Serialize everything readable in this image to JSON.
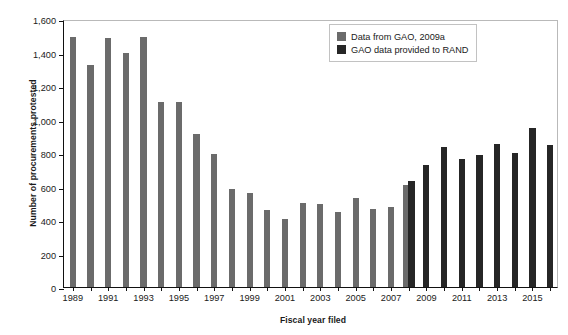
{
  "chart_data": {
    "type": "bar",
    "title": "",
    "xlabel": "Fiscal year filed",
    "ylabel": "Number of procurements protested",
    "ylim": [
      0,
      1600
    ],
    "yticks": [
      0,
      200,
      400,
      600,
      800,
      1000,
      1200,
      1400,
      1600
    ],
    "ytick_labels": [
      "0",
      "200",
      "400",
      "600",
      "800",
      "1,000",
      "1,200",
      "1,400",
      "1,600"
    ],
    "grid": false,
    "legend_position": "top-right",
    "categories": [
      "1989",
      "1990",
      "1991",
      "1992",
      "1993",
      "1994",
      "1995",
      "1996",
      "1997",
      "1998",
      "1999",
      "2000",
      "2001",
      "2002",
      "2003",
      "2004",
      "2005",
      "2006",
      "2007",
      "2008",
      "2009",
      "2010",
      "2011",
      "2012",
      "2013",
      "2014",
      "2015",
      "2016"
    ],
    "xtick_labels": [
      "1989",
      "1991",
      "1993",
      "1995",
      "1997",
      "1999",
      "2001",
      "2003",
      "2005",
      "2007",
      "2009",
      "2011",
      "2013",
      "2015"
    ],
    "series": [
      {
        "name": "Data from GAO, 2009a",
        "color": "#6b6b6b",
        "values": [
          1490,
          1325,
          1485,
          1400,
          1490,
          1105,
          1105,
          915,
          795,
          585,
          560,
          460,
          405,
          500,
          495,
          450,
          530,
          465,
          480,
          610,
          null,
          null,
          null,
          null,
          null,
          null,
          null,
          null
        ]
      },
      {
        "name": "GAO data provided to RAND",
        "color": "#262626",
        "values": [
          null,
          null,
          null,
          null,
          null,
          null,
          null,
          null,
          null,
          null,
          null,
          null,
          null,
          null,
          null,
          null,
          null,
          null,
          null,
          630,
          730,
          835,
          765,
          790,
          855,
          800,
          950,
          850
        ]
      }
    ]
  },
  "legend": {
    "entries": [
      {
        "label": "Data from GAO, 2009a",
        "swatch": "gao"
      },
      {
        "label": "GAO data provided to RAND",
        "swatch": "rand"
      }
    ]
  }
}
